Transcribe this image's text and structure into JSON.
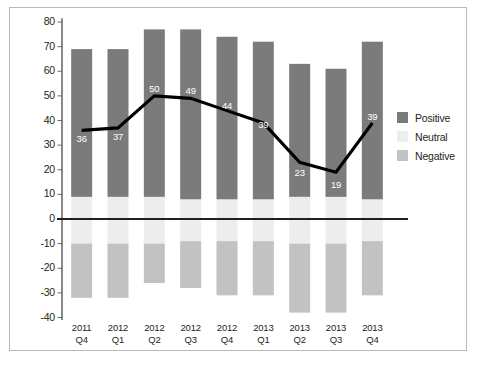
{
  "chart_data": {
    "type": "bar",
    "subtype": "diverging-stacked-bar-with-line-overlay",
    "title": "",
    "xlabel": "",
    "ylabel": "",
    "ylim": [
      -40,
      80
    ],
    "yticks": [
      80,
      70,
      60,
      50,
      40,
      30,
      20,
      10,
      0,
      -10,
      -20,
      -30,
      -40
    ],
    "ytick_labels": [
      "80",
      "70",
      "60",
      "50",
      "40",
      "30",
      "20",
      "10",
      "0",
      "-10",
      "-20",
      "-30",
      "-40"
    ],
    "grid": false,
    "legend_position": "right",
    "categories": [
      {
        "year": "2011",
        "quarter": "Q4"
      },
      {
        "year": "2012",
        "quarter": "Q1"
      },
      {
        "year": "2012",
        "quarter": "Q2"
      },
      {
        "year": "2012",
        "quarter": "Q3"
      },
      {
        "year": "2012",
        "quarter": "Q4"
      },
      {
        "year": "2013",
        "quarter": "Q1"
      },
      {
        "year": "2013",
        "quarter": "Q2"
      },
      {
        "year": "2013",
        "quarter": "Q3"
      },
      {
        "year": "2013",
        "quarter": "Q4"
      }
    ],
    "series": [
      {
        "name": "Positive",
        "color": "#7b7b7b",
        "values": [
          69,
          69,
          77,
          77,
          74,
          72,
          63,
          61,
          72
        ]
      },
      {
        "name": "Neutral",
        "color": "#ededed",
        "values": [
          9,
          9,
          9,
          8,
          8,
          8,
          9,
          9,
          8
        ]
      },
      {
        "name": "Negative",
        "color": "#c2c2c2",
        "values": [
          -32,
          -32,
          -26,
          -28,
          -31,
          -31,
          -38,
          -38,
          -31
        ]
      }
    ],
    "line_series": {
      "name": "Net",
      "color": "#000000",
      "values": [
        36,
        37,
        50,
        49,
        44,
        39,
        23,
        19,
        39
      ],
      "labels": [
        "36",
        "37",
        "50",
        "49",
        "44",
        "39",
        "23",
        "19",
        "39"
      ],
      "label_color": "#ffffff"
    }
  },
  "legend": {
    "items": [
      {
        "label": "Positive",
        "color": "#7b7b7b"
      },
      {
        "label": "Neutral",
        "color": "#ededed"
      },
      {
        "label": "Negative",
        "color": "#c2c2c2"
      }
    ]
  },
  "axis": {
    "zero_line_color": "#231f20",
    "axis_line_color": "#6b6b6b",
    "border_color": "#b9b9b9"
  }
}
